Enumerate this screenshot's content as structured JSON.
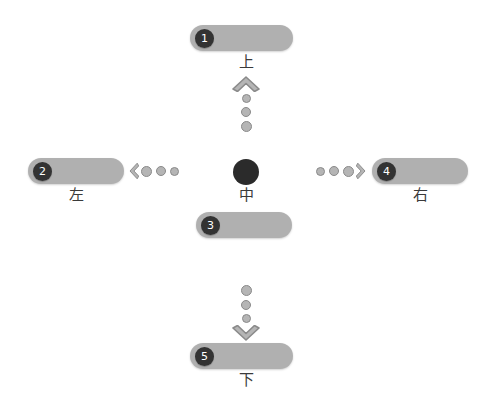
{
  "canvas": {
    "width": 493,
    "height": 405,
    "background": "#ffffff"
  },
  "theme": {
    "bar_color": "#b0b0b0",
    "badge_color": "#333333",
    "badge_text_color": "#ffffff",
    "center_dot_color": "#2b2b2b",
    "arrow_fill": "#b5b5b5",
    "arrow_stroke": "#8a8a8a",
    "label_color": "#3a3a3a"
  },
  "diagram": {
    "type": "directional-cross",
    "center": {
      "dot_name": "center-node",
      "label": "中"
    },
    "directions": [
      {
        "id": "up",
        "badge": "1",
        "label": "上",
        "arrow": "chevron-up",
        "dot_count": 3
      },
      {
        "id": "left",
        "badge": "2",
        "label": "左",
        "arrow": "chevron-left",
        "dot_count": 3
      },
      {
        "id": "center",
        "badge": "3",
        "label": "",
        "arrow": "",
        "dot_count": 0
      },
      {
        "id": "right",
        "badge": "4",
        "label": "右",
        "arrow": "chevron-right",
        "dot_count": 3
      },
      {
        "id": "down",
        "badge": "5",
        "label": "下",
        "arrow": "chevron-down",
        "dot_count": 3
      }
    ]
  }
}
